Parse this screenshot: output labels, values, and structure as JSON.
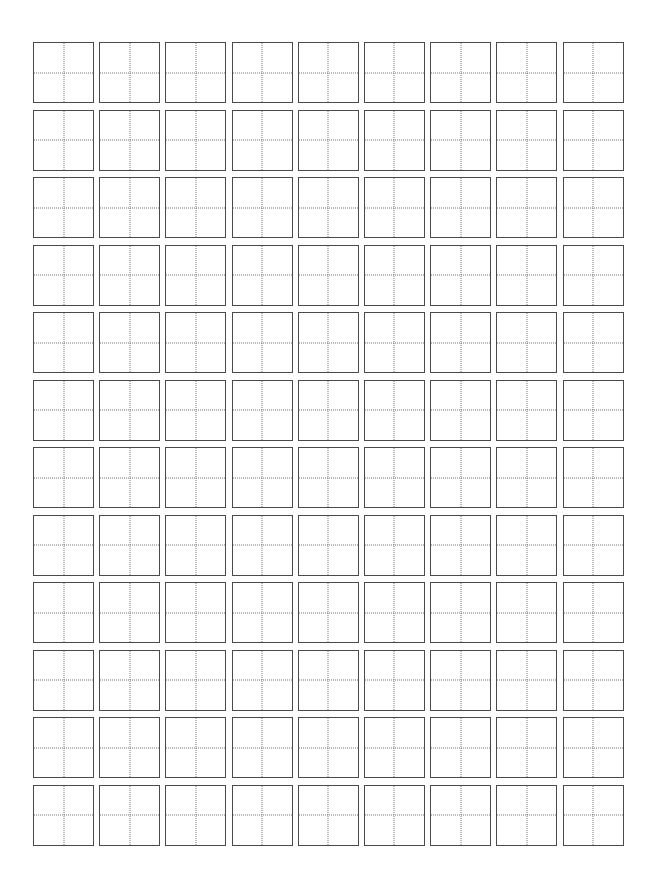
{
  "page": {
    "background_color": "#ffffff",
    "width_px": 661,
    "height_px": 893
  },
  "grid": {
    "name": "character-practice-grid",
    "description": "Blank square character-writing practice boxes with dotted centre cross guides",
    "columns": 9,
    "rows": 12,
    "total_cells": 108,
    "origin_x_px": 33,
    "origin_y_px": 42,
    "cell_size_px": 61,
    "column_gap_px": 5.2,
    "row_gap_px": 6.5,
    "cell": {
      "fill_color": "#ffffff",
      "border_color": "#4a4a4a",
      "border_width_px": 1.5,
      "border_style": "solid",
      "guide_color": "#767676",
      "guide_width_px": 1.3,
      "guide_style": "dotted",
      "guides": [
        "vertical-centre",
        "horizontal-centre"
      ],
      "content": ""
    }
  }
}
